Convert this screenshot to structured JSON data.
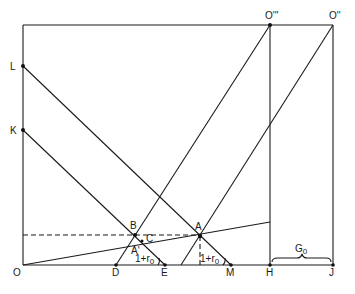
{
  "diagram": {
    "type": "geometric-economic-diagram",
    "labels": {
      "origin": "O",
      "top_left_axis_high": "L",
      "top_left_axis_low": "K",
      "top_O3": "O'''",
      "top_O2": "O''",
      "point_A": "A",
      "point_B": "B",
      "point_A_prime": "A'",
      "point_C": "C",
      "point_D": "D",
      "point_E": "E",
      "point_M": "M",
      "point_H": "H",
      "point_J": "J",
      "angle_label_left": "1+r",
      "angle_label_left_sub": "0",
      "angle_label_right": "1+r",
      "angle_label_right_sub": "0",
      "brace_label": "G",
      "brace_label_sub": "0"
    },
    "points": {
      "O": [
        23,
        265
      ],
      "L": [
        23,
        66
      ],
      "K": [
        23,
        130
      ],
      "O3": [
        270,
        25
      ],
      "O2": [
        333,
        25
      ],
      "A": [
        200,
        236
      ],
      "B": [
        135,
        235
      ],
      "A_prime": [
        133,
        245
      ],
      "C": [
        142,
        241
      ],
      "D": [
        116,
        265
      ],
      "E": [
        165,
        265
      ],
      "M": [
        231,
        265
      ],
      "H": [
        270,
        265
      ],
      "J": [
        333,
        265
      ]
    },
    "colors": {
      "ink": "#1a1a1a",
      "background": "#ffffff"
    }
  }
}
